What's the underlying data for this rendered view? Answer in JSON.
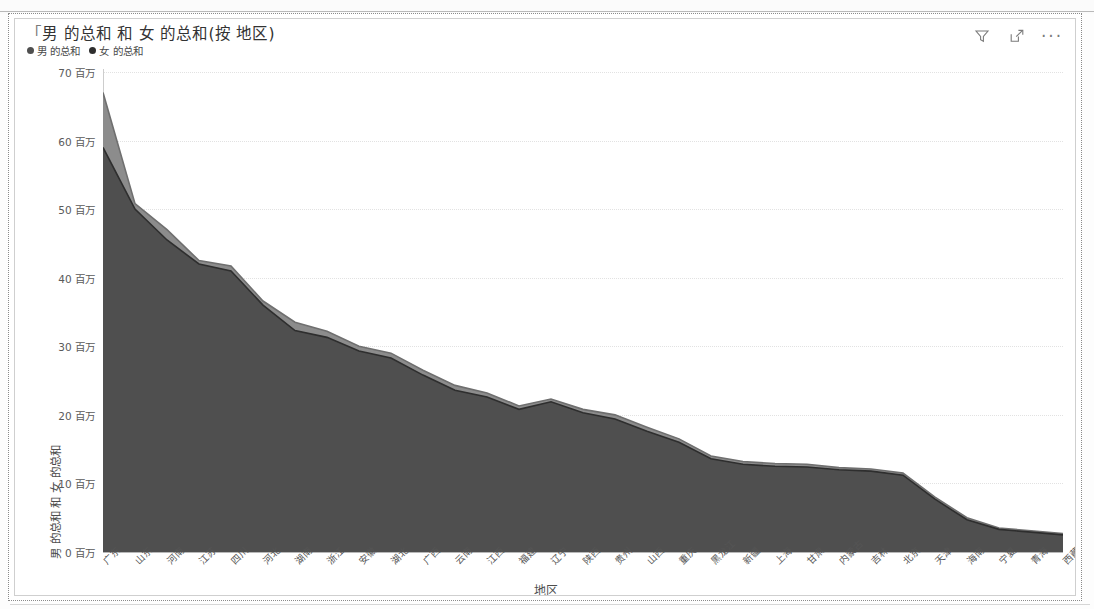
{
  "visual": {
    "title": "男 的总和 和 女 的总和(按 地区)",
    "title_quote_prefix": "「",
    "legend": [
      {
        "label": "男 的总和",
        "color": "#4f4f4f",
        "marker": "legend-dot-male"
      },
      {
        "label": "女 的总和",
        "color": "#2e2e2e",
        "marker": "legend-dot-female"
      }
    ],
    "header_icons": [
      {
        "name": "filter-icon",
        "tooltip": "筛选器"
      },
      {
        "name": "focus-mode-icon",
        "tooltip": "聚焦模式"
      },
      {
        "name": "more-options-icon",
        "tooltip": "更多选项",
        "glyph": "···"
      }
    ]
  },
  "chart_data": {
    "type": "area",
    "title": "男 的总和 和 女 的总和(按 地区)",
    "xlabel": "地区",
    "ylabel": "男 的总和 和 女 的总和",
    "ylim": [
      0,
      70
    ],
    "yticks": [
      0,
      10,
      20,
      30,
      40,
      50,
      60,
      70
    ],
    "ytick_labels": [
      "0 百万",
      "10 百万",
      "20 百万",
      "30 百万",
      "40 百万",
      "50 百万",
      "60 百万",
      "70 百万"
    ],
    "y_unit": "百万",
    "grid": true,
    "legend_position": "top-left",
    "stacked": false,
    "categories": [
      "广东",
      "山东",
      "河南",
      "江苏",
      "四川",
      "河北",
      "湖南",
      "浙江",
      "安徽",
      "湖北",
      "广西",
      "云南",
      "江西",
      "福建",
      "辽宁",
      "陕西",
      "贵州",
      "山西",
      "重庆",
      "黑龙江",
      "新疆",
      "上海",
      "甘肃",
      "内蒙古",
      "吉林",
      "北京",
      "天津",
      "海南",
      "宁夏",
      "青海",
      "西藏"
    ],
    "series": [
      {
        "name": "女 的总和",
        "color": "#8c8c8c",
        "values": [
          67.0,
          50.8,
          47.0,
          42.5,
          41.7,
          36.6,
          33.5,
          32.2,
          30.0,
          29.0,
          26.5,
          24.3,
          23.2,
          21.3,
          22.3,
          20.8,
          20.0,
          18.2,
          16.5,
          14.0,
          13.2,
          12.9,
          12.8,
          12.3,
          12.1,
          11.5,
          8.0,
          5.0,
          3.5,
          3.1,
          2.7
        ]
      },
      {
        "name": "男 的总和",
        "color": "#4f4f4f",
        "values": [
          59.0,
          50.0,
          45.5,
          42.0,
          41.0,
          36.0,
          32.3,
          31.3,
          29.3,
          28.3,
          25.8,
          23.6,
          22.6,
          20.8,
          21.9,
          20.3,
          19.4,
          17.6,
          16.0,
          13.6,
          12.8,
          12.5,
          12.4,
          12.0,
          11.8,
          11.2,
          7.7,
          4.7,
          3.3,
          2.9,
          2.5
        ]
      }
    ]
  },
  "colors": {
    "series_light": "#8c8c8c",
    "series_dark": "#4f4f4f",
    "stroke_dark": "#2e2e2e",
    "gridline": "#e2e2e2",
    "axis": "#b8b8b8",
    "text": "#555555"
  }
}
